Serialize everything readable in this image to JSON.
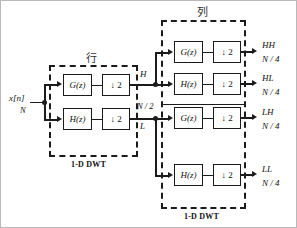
{
  "diagram": {
    "type": "signal-flow-block-diagram",
    "input": {
      "signal_label": "x[n]",
      "size_label": "N"
    },
    "stages": [
      {
        "id": "row-stage",
        "cjk_label": "行",
        "caption": "1-D DWT",
        "branches": [
          {
            "filter": "G(z)",
            "downsample": "↓ 2",
            "out_label": "H",
            "out_size": "N / 2"
          },
          {
            "filter": "H(z)",
            "downsample": "↓ 2",
            "out_label": "L",
            "out_size": "N / 2"
          }
        ]
      },
      {
        "id": "column-stage",
        "cjk_label": "列",
        "caption": "1-D DWT",
        "branches": [
          {
            "filter": "G(z)",
            "downsample": "↓ 2",
            "out_label": "HH",
            "out_size": "N / 4"
          },
          {
            "filter": "H(z)",
            "downsample": "↓ 2",
            "out_label": "HL",
            "out_size": "N / 4"
          },
          {
            "filter": "G(z)",
            "downsample": "↓ 2",
            "out_label": "LH",
            "out_size": "N / 4"
          },
          {
            "filter": "H(z)",
            "downsample": "↓ 2",
            "out_label": "LL",
            "out_size": "N / 4"
          }
        ]
      }
    ],
    "colors": {
      "line": "#1b1b1b",
      "box_fill": "#ffffff",
      "background": "#ffffff",
      "frame": "#b9b9b9"
    }
  }
}
